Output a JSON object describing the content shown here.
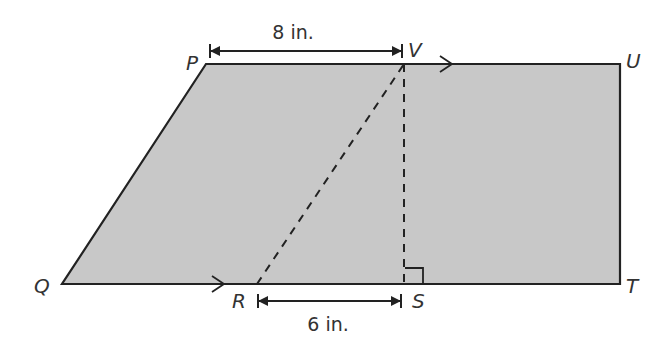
{
  "diagram": {
    "type": "trapezoid-decomposition",
    "shape_fill": "#c8c8c8",
    "stroke_color": "#222222",
    "vertices": {
      "P": {
        "label": "P",
        "x": 206,
        "y": 64
      },
      "U": {
        "label": "U",
        "x": 620,
        "y": 64
      },
      "T": {
        "label": "T",
        "x": 620,
        "y": 284
      },
      "Q": {
        "label": "Q",
        "x": 62,
        "y": 284
      },
      "V": {
        "label": "V",
        "x": 404,
        "y": 64
      },
      "S": {
        "label": "S",
        "x": 404,
        "y": 284
      },
      "R": {
        "label": "R",
        "x": 257,
        "y": 284
      }
    },
    "segments": {
      "dashed": [
        "RV",
        "VS"
      ],
      "parallel_marked": [
        "PU",
        "QT"
      ],
      "right_angle_at": "S"
    },
    "dimensions": [
      {
        "from": "P",
        "to": "V",
        "label": "8 in."
      },
      {
        "from": "R",
        "to": "S",
        "label": "6 in."
      }
    ]
  }
}
